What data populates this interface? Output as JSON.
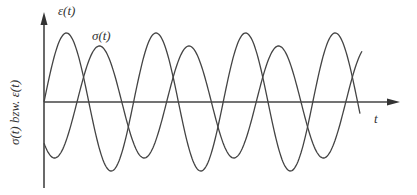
{
  "labels": {
    "y_axis": "σ(t) bzw. ε(t)",
    "epsilon": "ε(t)",
    "sigma": "σ(t)",
    "x_axis": "t"
  },
  "colors": {
    "stroke": "#444444",
    "background": "#ffffff"
  },
  "chart_data": {
    "type": "line",
    "title": "",
    "xlabel": "t",
    "ylabel": "σ(t) bzw. ε(t)",
    "series": [
      {
        "name": "ε(t)",
        "shape": "sine",
        "amplitude": 1.0,
        "phase_offset_periods": 0,
        "periods_shown": 3.5
      },
      {
        "name": "σ(t)",
        "shape": "sine",
        "amplitude": 0.8,
        "phase_lag_periods": 0.37,
        "periods_shown": 3.5
      }
    ],
    "grid": false,
    "legend": "inline labels"
  },
  "geometry": {
    "origin_x": 44,
    "origin_y": 102,
    "x_end": 400,
    "y_top": 12,
    "y_bottom": 188,
    "period": 89.6,
    "eps_amp": 69,
    "eps_start": 44,
    "eps_end": 360,
    "sig_amp": 56,
    "sig_shift": 33,
    "sig_end": 362
  }
}
